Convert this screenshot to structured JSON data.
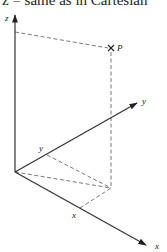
{
  "caption": "z = same as in Cartesian",
  "labels": {
    "z_axis": "z",
    "y_axis": "y",
    "x_axis": "x",
    "point": "P",
    "y_projection": "y",
    "x_projection": "x"
  },
  "colors": {
    "axis": "#333333",
    "dashed": "#555555",
    "text": "#222222"
  }
}
